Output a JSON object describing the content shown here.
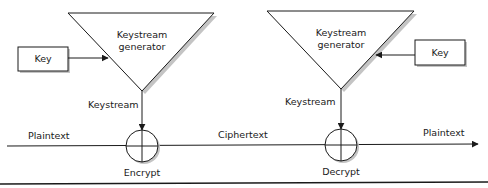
{
  "diagram": {
    "colors": {
      "stroke": "#1a1a1a",
      "shadow": "#b8b8b8",
      "background": "#ffffff"
    },
    "encrypt_side": {
      "generator_label_line1": "Keystream",
      "generator_label_line2": "generator",
      "key_label": "Key",
      "keystream_label": "Keystream",
      "operation_label": "Encrypt",
      "operation_symbol": "xor-circle-plus"
    },
    "decrypt_side": {
      "generator_label_line1": "Keystream",
      "generator_label_line2": "generator",
      "key_label": "Key",
      "keystream_label": "Keystream",
      "operation_label": "Decrypt",
      "operation_symbol": "xor-circle-plus"
    },
    "flow": {
      "input_label": "Plaintext",
      "middle_label": "Ciphertext",
      "output_label": "Plaintext"
    }
  }
}
